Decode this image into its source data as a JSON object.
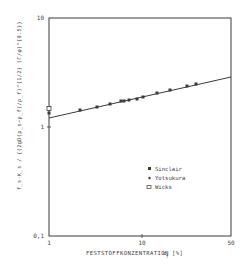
{
  "chart_data": {
    "type": "scatter",
    "title": "",
    "xlabel": "FESTSTOFFKONZENTRATION  c_T [%]",
    "ylabel": "f_s * K_s / {(2gD(ρ_s - ρ_f)/ρ_f)^0.5 ...}",
    "xscale": "log",
    "yscale": "log",
    "xlim": [
      1,
      50
    ],
    "ylim": [
      0.1,
      10
    ],
    "x_ticks": [
      "1",
      "10",
      "50"
    ],
    "y_ticks": [
      "0.1",
      "1",
      "10"
    ],
    "grid": false,
    "legend_position": "lower-right-inside",
    "series": [
      {
        "name": "Sinclair",
        "marker": "filled-square",
        "x": [
          1,
          2.15,
          3.3,
          4.5,
          5.9,
          6.4,
          7.3,
          8.9,
          10.2,
          14.5,
          20,
          30,
          38
        ],
        "y": [
          1.34,
          1.43,
          1.53,
          1.63,
          1.73,
          1.73,
          1.77,
          1.81,
          1.88,
          2.05,
          2.18,
          2.38,
          2.48
        ]
      },
      {
        "name": "Yotsukura",
        "marker": "filled-small",
        "x": [],
        "y": []
      },
      {
        "name": "Wicks",
        "marker": "open-square",
        "x": [
          1
        ],
        "y": [
          1.46
        ]
      }
    ],
    "fit_line": {
      "x": [
        1,
        50
      ],
      "y": [
        1.22,
        2.88
      ]
    }
  },
  "axes": {
    "x_ticks": [
      {
        "label": "1",
        "px": 49
      },
      {
        "label": "10",
        "px": 142
      },
      {
        "label": "50",
        "px": 231
      }
    ],
    "y_ticks": [
      {
        "label": "10",
        "py": 18
      },
      {
        "label": "1",
        "py": 127
      },
      {
        "label": "0,1",
        "py": 236
      }
    ],
    "xlabel_main": "FESTSTOFFKONZENTRATION",
    "xlabel_symbol": "c",
    "xlabel_sub": "T",
    "xlabel_unit": "[%]",
    "ylabel": "f_s·K_s / {(2gD(ρ_s−ρ_f)/ρ_f)^{1/2} (Γ/φ)^{0.5}}"
  },
  "legend": {
    "items": [
      {
        "label": "Sinclair",
        "marker": "filled-square"
      },
      {
        "label": "Yotsukura",
        "marker": "filled-small"
      },
      {
        "label": "Wicks",
        "marker": "open-square"
      }
    ]
  },
  "plot_points_px": [
    [
      80,
      110
    ],
    [
      97,
      107
    ],
    [
      110,
      104
    ],
    [
      121,
      101
    ],
    [
      124,
      101
    ],
    [
      129,
      100
    ],
    [
      137,
      99
    ],
    [
      143,
      97
    ],
    [
      157,
      93
    ],
    [
      170,
      90
    ],
    [
      187,
      86
    ],
    [
      196,
      84
    ]
  ],
  "colors": {
    "ink": "#3a3a3a",
    "background": "#ffffff"
  }
}
